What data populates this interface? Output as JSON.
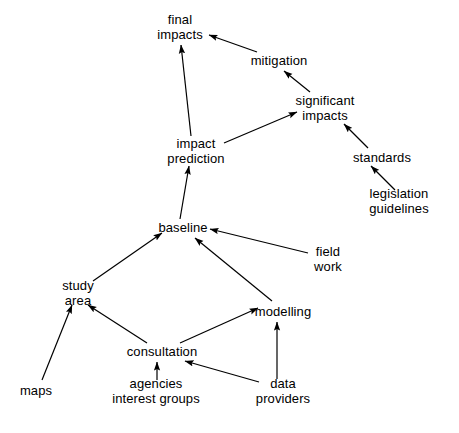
{
  "diagram": {
    "background_color": "#ffffff",
    "line_color": "#000000",
    "text_color": "#000000",
    "nodes": [
      {
        "id": "final_impacts",
        "label_line1": "final",
        "label_line2": "impacts",
        "x": 180,
        "y": 27
      },
      {
        "id": "mitigation",
        "label_line1": "mitigation",
        "label_line2": "",
        "x": 279,
        "y": 61
      },
      {
        "id": "significant_impacts",
        "label_line1": "significant",
        "label_line2": "impacts",
        "x": 325,
        "y": 108
      },
      {
        "id": "standards",
        "label_line1": "standards",
        "label_line2": "",
        "x": 382,
        "y": 158
      },
      {
        "id": "legislation_guidelines",
        "label_line1": "legislation",
        "label_line2": "guidelines",
        "x": 399,
        "y": 201
      },
      {
        "id": "impact_prediction",
        "label_line1": "impact",
        "label_line2": "prediction",
        "x": 196,
        "y": 151
      },
      {
        "id": "baseline",
        "label_line1": "baseline",
        "label_line2": "",
        "x": 183,
        "y": 228
      },
      {
        "id": "field_work",
        "label_line1": "field",
        "label_line2": "work",
        "x": 328,
        "y": 259
      },
      {
        "id": "study_area",
        "label_line1": "study",
        "label_line2": "area",
        "x": 78,
        "y": 293
      },
      {
        "id": "modelling",
        "label_line1": "modelling",
        "label_line2": "",
        "x": 283,
        "y": 312
      },
      {
        "id": "consultation",
        "label_line1": "consultation",
        "label_line2": "",
        "x": 162,
        "y": 352
      },
      {
        "id": "maps",
        "label_line1": "maps",
        "label_line2": "",
        "x": 36,
        "y": 391
      },
      {
        "id": "agencies_interest_groups",
        "label_line1": "agencies",
        "label_line2": "interest groups",
        "x": 156,
        "y": 391
      },
      {
        "id": "data_providers",
        "label_line1": "data",
        "label_line2": "providers",
        "x": 283,
        "y": 391
      }
    ],
    "edges": [
      {
        "id": "e1",
        "from": "impact_prediction",
        "to": "final_impacts",
        "x1": 191,
        "y1": 136,
        "x2": 181,
        "y2": 45
      },
      {
        "id": "e2",
        "from": "mitigation",
        "to": "final_impacts",
        "x1": 257,
        "y1": 52,
        "x2": 209,
        "y2": 35
      },
      {
        "id": "e3",
        "from": "significant_impacts",
        "to": "mitigation",
        "x1": 310,
        "y1": 92,
        "x2": 284,
        "y2": 71
      },
      {
        "id": "e4",
        "from": "impact_prediction",
        "to": "significant_impacts",
        "x1": 224,
        "y1": 143,
        "x2": 297,
        "y2": 112
      },
      {
        "id": "e5",
        "from": "standards",
        "to": "significant_impacts",
        "x1": 368,
        "y1": 148,
        "x2": 344,
        "y2": 124
      },
      {
        "id": "e6",
        "from": "legislation_guidelines",
        "to": "standards",
        "x1": 395,
        "y1": 190,
        "x2": 371,
        "y2": 166
      },
      {
        "id": "e7",
        "from": "baseline",
        "to": "impact_prediction",
        "x1": 180,
        "y1": 219,
        "x2": 189,
        "y2": 166
      },
      {
        "id": "e8",
        "from": "study_area",
        "to": "baseline",
        "x1": 93,
        "y1": 281,
        "x2": 162,
        "y2": 233
      },
      {
        "id": "e9",
        "from": "modelling",
        "to": "baseline",
        "x1": 272,
        "y1": 301,
        "x2": 195,
        "y2": 238
      },
      {
        "id": "e10",
        "from": "field_work",
        "to": "baseline",
        "x1": 308,
        "y1": 253,
        "x2": 210,
        "y2": 229
      },
      {
        "id": "e11",
        "from": "maps",
        "to": "study_area",
        "x1": 42,
        "y1": 380,
        "x2": 72,
        "y2": 305
      },
      {
        "id": "e12",
        "from": "consultation",
        "to": "study_area",
        "x1": 147,
        "y1": 343,
        "x2": 88,
        "y2": 305
      },
      {
        "id": "e13",
        "from": "consultation",
        "to": "modelling",
        "x1": 180,
        "y1": 343,
        "x2": 258,
        "y2": 308
      },
      {
        "id": "e14",
        "from": "agencies_interest_groups",
        "to": "consultation",
        "x1": 157,
        "y1": 380,
        "x2": 157,
        "y2": 362
      },
      {
        "id": "e15",
        "from": "data_providers",
        "to": "consultation",
        "x1": 259,
        "y1": 382,
        "x2": 185,
        "y2": 361
      },
      {
        "id": "e16",
        "from": "data_providers",
        "to": "modelling",
        "x1": 277,
        "y1": 379,
        "x2": 277,
        "y2": 322
      }
    ]
  }
}
